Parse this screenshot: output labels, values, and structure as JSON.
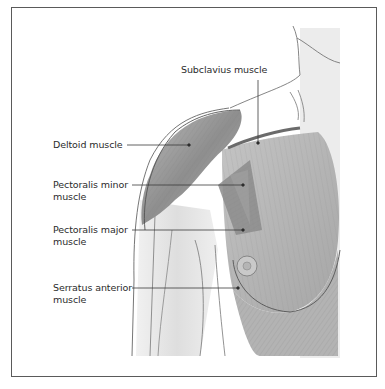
{
  "figure": {
    "background_color": "#ffffff",
    "frame_color": "#5a5a5a",
    "muscle_tone": "#9a9a9a",
    "skin_tone": "#ececec",
    "outline_color": "#555555",
    "labels": [
      {
        "id": "subclavius",
        "text": "Subclavius muscle",
        "x": 181,
        "y": 64,
        "point": [
          258,
          143
        ]
      },
      {
        "id": "deltoid",
        "text": "Deltoid muscle",
        "x": 53,
        "y": 139,
        "point": [
          189,
          145
        ]
      },
      {
        "id": "pectoralis-minor",
        "text": "Pectoralis minor\nmuscle",
        "x": 53,
        "y": 179,
        "point": [
          243,
          185
        ]
      },
      {
        "id": "pectoralis-major",
        "text": "Pectoralis major\nmuscle",
        "x": 53,
        "y": 224,
        "point": [
          243,
          230
        ]
      },
      {
        "id": "serratus-anterior",
        "text": "Serratus anterior\nmuscle",
        "x": 53,
        "y": 282,
        "point": [
          238,
          288
        ]
      }
    ]
  }
}
